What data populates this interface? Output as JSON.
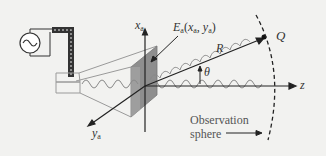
{
  "labels": {
    "x_axis": "x",
    "x_axis_sub": "a",
    "y_axis": "y",
    "y_axis_sub": "a",
    "z_axis": "z",
    "aperture_field": "E",
    "aperture_field_sub": "a",
    "aperture_field_args_open": "(",
    "aperture_field_x": "x",
    "aperture_field_x_sub": "a",
    "aperture_field_sep": ", ",
    "aperture_field_y": "y",
    "aperture_field_y_sub": "a",
    "aperture_field_args_close": ")",
    "range": "R",
    "angle": "θ",
    "point": "Q",
    "observation_line1": "Observation",
    "observation_line2": "sphere"
  },
  "icons": {
    "source": "ac-source-icon"
  },
  "colors": {
    "background": "#f2f2f0",
    "line": "#222222",
    "horn_outline": "#9a9a9a",
    "aperture_fill": "#8e8e8e",
    "wave": "#8a8a8a",
    "text": "#333333"
  }
}
